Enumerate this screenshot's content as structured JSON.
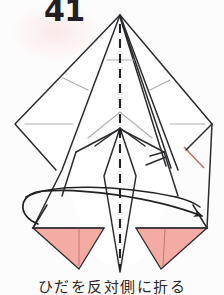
{
  "page": {
    "step_number": "41",
    "caption": "ひだを反対側に折る",
    "background_color": "#fdfcfc"
  },
  "colors": {
    "paper_front": "#ffffff",
    "paper_back_pink": "#f4aba4",
    "pink_light": "#f7bdb6",
    "outline_dark": "#2b2a2e",
    "crease_gray": "#a9a6ad",
    "crease_light": "#c4c1c6",
    "text": "#232024",
    "red_edge": "#b9736d"
  },
  "diagram": {
    "type": "origami-fold-step",
    "title_label": "41",
    "elements": [
      {
        "name": "center-dashed-line",
        "kind": "dashed-line",
        "orientation": "vertical",
        "label": "valley/centre axis"
      },
      {
        "name": "apex-point",
        "kind": "vertex",
        "label": "top apex"
      },
      {
        "name": "left-wing",
        "kind": "polygon",
        "label": "left wing panel"
      },
      {
        "name": "right-wing",
        "kind": "polygon",
        "label": "right wing panel"
      },
      {
        "name": "left-pink-flap",
        "kind": "polygon",
        "label": "left back-colour flap"
      },
      {
        "name": "right-pink-flap",
        "kind": "polygon",
        "label": "right back-colour flap"
      },
      {
        "name": "center-spine",
        "kind": "polygon",
        "label": "central narrow spine flap"
      },
      {
        "name": "fold-arrow",
        "kind": "arrow",
        "label": "fold-to-opposite-side arrow"
      }
    ]
  }
}
